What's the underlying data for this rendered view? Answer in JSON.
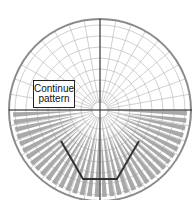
{
  "diagram": {
    "type": "polar-grid-pattern",
    "label": {
      "line1": "Continue",
      "line2": "pattern"
    },
    "center": [
      100,
      110
    ],
    "outer_radius": 91,
    "ring_spacing": 11,
    "radial_step_deg": 10,
    "colors": {
      "grid": "#b0b0b0",
      "outline": "#8a8a8a",
      "axis": "#222222",
      "wedge": "#9a9a9a",
      "polyline": "#333333"
    },
    "polyline": [
      [
        61,
        141
      ],
      [
        83,
        179
      ],
      [
        117,
        179
      ],
      [
        139,
        141
      ]
    ]
  }
}
